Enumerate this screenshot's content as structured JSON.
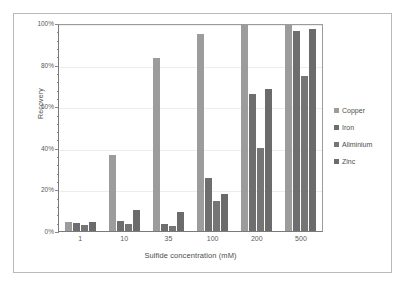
{
  "chart_data": {
    "type": "bar",
    "title": "",
    "subtitle": "",
    "xlabel": "Sulfide concentration (mM)",
    "ylabel": "Recovery",
    "categories": [
      "1",
      "10",
      "35",
      "100",
      "200",
      "500"
    ],
    "ylim": [
      0,
      100
    ],
    "ytick_labels": [
      "0%",
      "20%",
      "40%",
      "60%",
      "80%",
      "100%"
    ],
    "ytick_values": [
      0,
      20,
      40,
      60,
      80,
      100
    ],
    "y_unit": "%",
    "grid": true,
    "legend_position": "right",
    "series": [
      {
        "name": "Copper",
        "color": "#9c9c9c",
        "values": [
          4.5,
          36.8,
          83.5,
          95.2,
          99.3,
          100.0
        ]
      },
      {
        "name": "Iron",
        "color": "#6e6e6e",
        "values": [
          4.0,
          4.6,
          3.4,
          25.6,
          66.2,
          96.8
        ]
      },
      {
        "name": "Aliminium",
        "color": "#757575",
        "values": [
          2.7,
          3.5,
          2.2,
          14.6,
          40.3,
          74.8
        ]
      },
      {
        "name": "Zinc",
        "color": "#6b6b6b",
        "values": [
          4.2,
          10.2,
          9.3,
          18.0,
          68.8,
          97.4
        ]
      }
    ]
  },
  "axes": {
    "y_title": "Recovery",
    "x_title": "Sulfide concentration (mM)"
  },
  "legend": {
    "items": [
      {
        "label": "Copper"
      },
      {
        "label": "Iron"
      },
      {
        "label": "Aliminium"
      },
      {
        "label": "Zinc"
      }
    ]
  },
  "style": {
    "frame_color": "#b9b9b9",
    "axis_color": "#7a7a7a",
    "grid_color": "#ededed",
    "text_color": "#4d4d4d",
    "background": "#ffffff"
  }
}
